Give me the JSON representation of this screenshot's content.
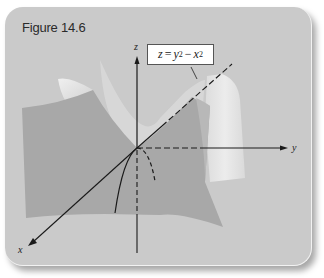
{
  "figure": {
    "title": "Figure 14.6",
    "equation": {
      "lhs": "z",
      "eq": "=",
      "term1_base": "y",
      "term1_exp": "2",
      "minus": "−",
      "term2_base": "x",
      "term2_exp": "2",
      "full_text": "z = y² − x²"
    },
    "axes": {
      "x_label": "x",
      "y_label": "y",
      "z_label": "z"
    }
  },
  "colors": {
    "card_background": "#cacaca",
    "surface_dark": "#a9a9a9",
    "surface_light": "#e4e4e4",
    "axis_line": "#1a1a1a",
    "label_box_background": "#ffffff"
  }
}
